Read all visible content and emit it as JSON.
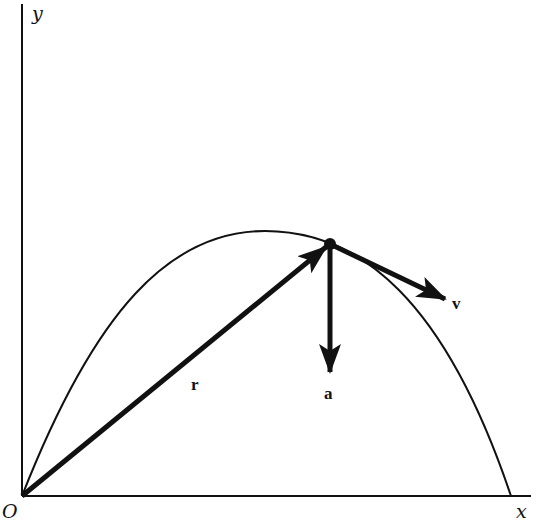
{
  "diagram": {
    "colors": {
      "ink": "#111111",
      "background": "#ffffff"
    },
    "axes": {
      "x_label": "x",
      "y_label": "y",
      "origin_label": "O"
    },
    "vectors": {
      "position": {
        "label": "r"
      },
      "velocity": {
        "label": "v"
      },
      "acceleration": {
        "label": "a"
      }
    }
  }
}
